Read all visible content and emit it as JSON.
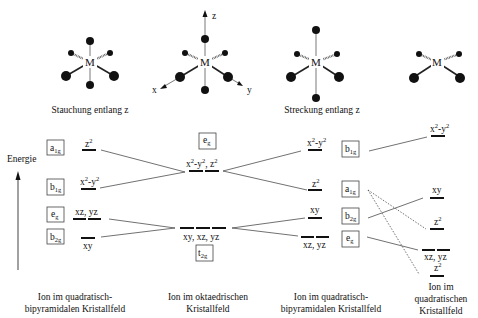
{
  "molecules": [
    {
      "id": "compressed",
      "caption": "Stauchung entlang z",
      "cx": 90,
      "cy": 62,
      "axial": 20,
      "label": "M"
    },
    {
      "id": "octahedral",
      "caption": "",
      "cx": 203,
      "cy": 62,
      "axial": 27,
      "label": "M",
      "axes": {
        "z": "z",
        "x": "x",
        "y": "y"
      }
    },
    {
      "id": "elongated",
      "caption": "Streckung entlang z",
      "cx": 316,
      "cy": 62,
      "axial": 35,
      "label": "M"
    },
    {
      "id": "square-planar",
      "caption": "",
      "cx": 437,
      "cy": 62,
      "axial": 0,
      "label": "M"
    }
  ],
  "energy_axis": {
    "label": "Energie"
  },
  "columns": [
    {
      "id": "compressed-bipyramidal",
      "caption_lines": [
        "Ion im quadratisch-",
        "bipyramidalen Kristallfeld"
      ],
      "boxes": [
        {
          "sym": "a",
          "sub": "1g",
          "y": 148
        },
        {
          "sym": "b",
          "sub": "1g",
          "y": 188
        },
        {
          "sym": "e",
          "sub": "g",
          "y": 216
        },
        {
          "sym": "b",
          "sub": "2g",
          "y": 238
        }
      ],
      "levels": [
        {
          "label": "z",
          "sup": "2",
          "y": 150,
          "n": 1,
          "labelPos": "above"
        },
        {
          "label": "x",
          "sup": "2",
          "label2": "-y",
          "sup2": "2",
          "y": 189,
          "n": 1,
          "labelPos": "above"
        },
        {
          "label": "xz, yz",
          "y": 218,
          "n": 2,
          "labelPos": "above"
        },
        {
          "label": "xy",
          "y": 238,
          "n": 1,
          "labelPos": "below"
        }
      ]
    },
    {
      "id": "octahedral",
      "caption_lines": [
        "Ion im oktaedrischen",
        "Kristallfeld"
      ],
      "boxes": [
        {
          "sym": "e",
          "sub": "g",
          "y": 141
        },
        {
          "sym": "t",
          "sub": "2g",
          "y": 253
        }
      ],
      "levels": [
        {
          "label": "x",
          "sup": "2",
          "label2": "-y",
          "sup2": "2",
          "label3": ", z",
          "sup3": "2",
          "y": 171,
          "n": 2,
          "labelPos": "above"
        },
        {
          "label": "xy, xz, yz",
          "y": 228,
          "n": 3,
          "labelPos": "below"
        }
      ]
    },
    {
      "id": "elongated-bipyramidal",
      "caption_lines": [
        "Ion im quadratisch-",
        "bipyramidalen Kristallfeld"
      ],
      "levels": [
        {
          "label": "x",
          "sup": "2",
          "label2": "-y",
          "sup2": "2",
          "y": 150,
          "n": 1,
          "labelPos": "above"
        },
        {
          "label": "z",
          "sup": "2",
          "y": 190,
          "n": 1,
          "labelPos": "above"
        },
        {
          "label": "xy",
          "y": 218,
          "n": 1,
          "labelPos": "above"
        },
        {
          "label": "xz, yz",
          "y": 237,
          "n": 2,
          "labelPos": "below"
        }
      ],
      "boxes": [
        {
          "sym": "b",
          "sub": "1g",
          "y": 149
        },
        {
          "sym": "a",
          "sub": "1g",
          "y": 189
        },
        {
          "sym": "b",
          "sub": "2g",
          "y": 216
        },
        {
          "sym": "e",
          "sub": "g",
          "y": 240
        }
      ]
    },
    {
      "id": "square-planar",
      "caption_lines": [
        "Ion im",
        "quadratischen",
        "Kristallfeld"
      ],
      "levels": [
        {
          "label": "x",
          "sup": "2",
          "label2": "-y",
          "sup2": "2",
          "y": 136,
          "n": 1,
          "labelPos": "above"
        },
        {
          "label": "xy",
          "y": 198,
          "n": 1,
          "labelPos": "above"
        },
        {
          "label": "z",
          "sup": "2",
          "y": 229,
          "n": 1,
          "labelPos": "above"
        },
        {
          "label": "xz, yz",
          "y": 250,
          "n": 2,
          "labelPos": "below"
        },
        {
          "label": "z",
          "sup": "2",
          "y": 274,
          "n": 1,
          "labelPos": "above"
        }
      ]
    }
  ],
  "colors": {
    "line": "#111111",
    "box_border": "#444444",
    "background": "#ffffff"
  }
}
